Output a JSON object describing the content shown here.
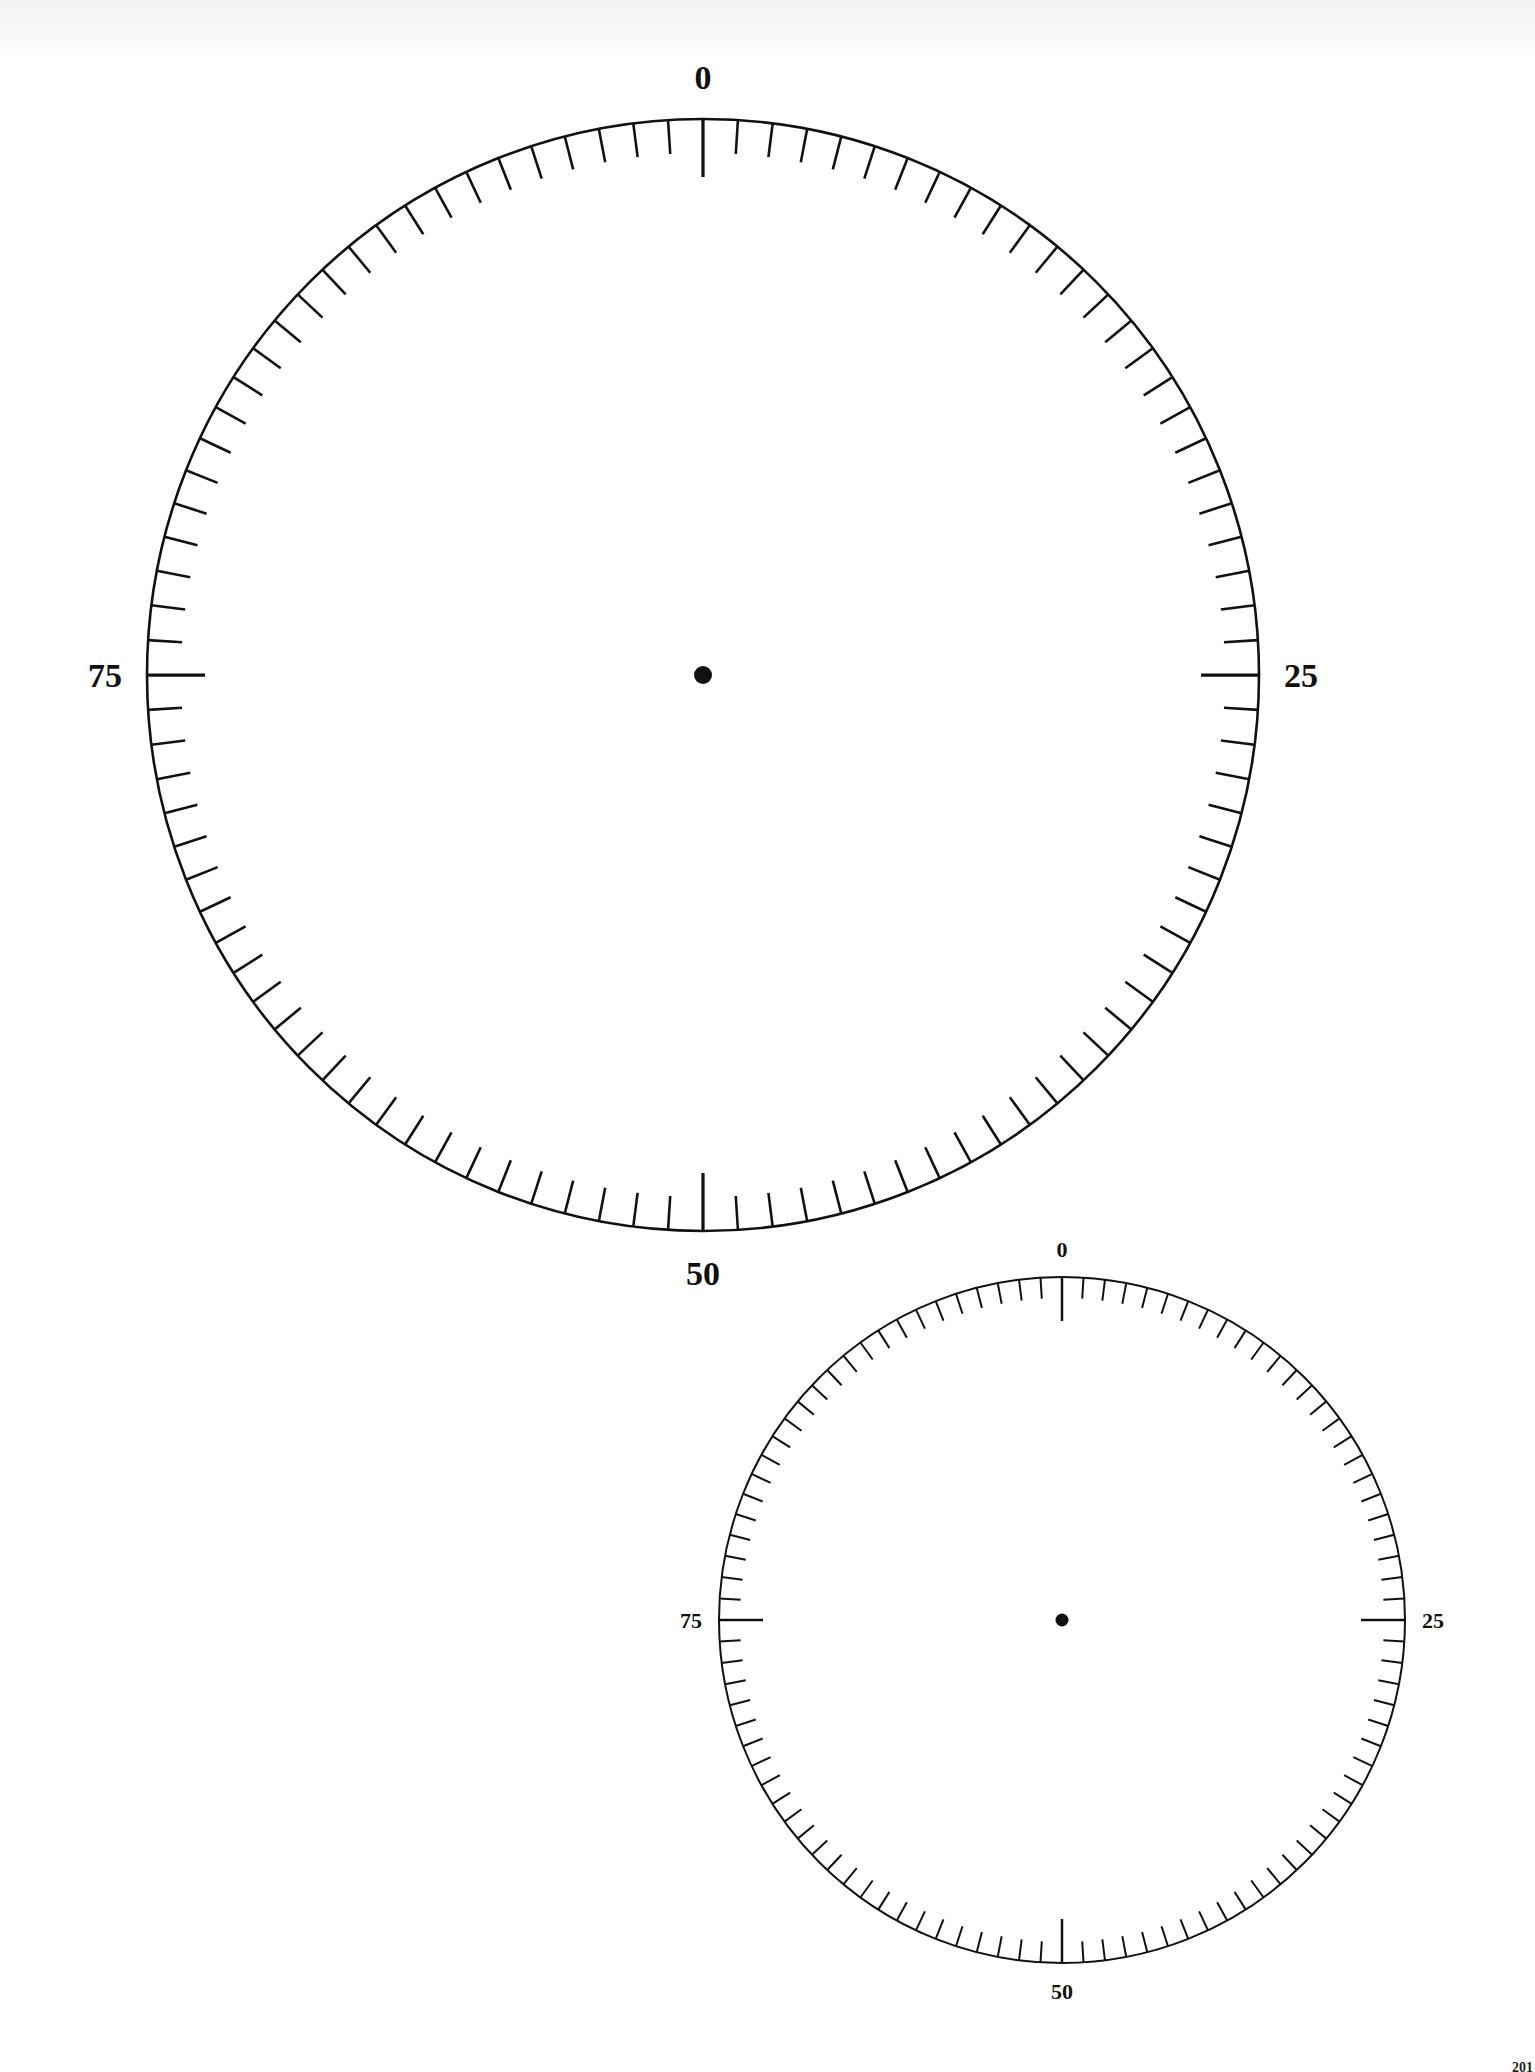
{
  "page": {
    "page_number": "201",
    "background": "#ffffff",
    "ink_color": "#111111"
  },
  "dials": [
    {
      "id": "large-dial",
      "center": [
        703,
        675
      ],
      "radius": 556,
      "tick_count": 100,
      "minor_tick_length": 34,
      "major_tick_length": 58,
      "stroke_width": 2.6,
      "center_dot_radius": 9,
      "label_font_size": 34,
      "label_offset": 42,
      "labels": [
        {
          "value": "0",
          "position": 0
        },
        {
          "value": "25",
          "position": 25
        },
        {
          "value": "50",
          "position": 50
        },
        {
          "value": "75",
          "position": 75
        }
      ]
    },
    {
      "id": "small-dial",
      "center": [
        1062,
        1620
      ],
      "radius": 343,
      "tick_count": 100,
      "minor_tick_length": 21,
      "major_tick_length": 44,
      "stroke_width": 2,
      "center_dot_radius": 6.5,
      "label_font_size": 22,
      "label_offset": 28,
      "labels": [
        {
          "value": "0",
          "position": 0
        },
        {
          "value": "25",
          "position": 25
        },
        {
          "value": "50",
          "position": 50
        },
        {
          "value": "75",
          "position": 75
        }
      ]
    }
  ]
}
